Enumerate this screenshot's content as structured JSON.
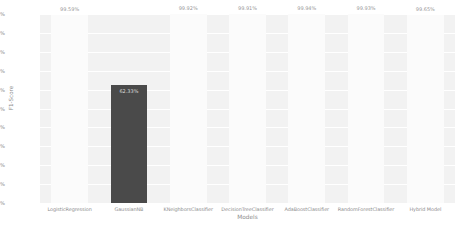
{
  "chart_data": {
    "type": "bar",
    "title": "",
    "xlabel": "Models",
    "ylabel": "F1-Score",
    "ylim": [
      0,
      100
    ],
    "grid": true,
    "legend": "none",
    "yticks": [
      "100%",
      "90%",
      "80%",
      "70%",
      "60%",
      "50%",
      "40%",
      "30%",
      "20%",
      "10%",
      "0%"
    ],
    "categories": [
      "LogisticRegression",
      "GaussianNB",
      "KNeighborsClassifier",
      "DecisionTreeClassifier",
      "AdaBoostClassifier",
      "RandomForestClassifier",
      "Hybrid Model"
    ],
    "values": [
      99.59,
      62.33,
      99.92,
      99.91,
      99.94,
      99.93,
      99.65
    ],
    "data_labels": [
      "99.59%",
      "62.33%",
      "99.92%",
      "99.91%",
      "99.94%",
      "99.93%",
      "99.65%"
    ],
    "bar_colors": [
      "#fbfbfb",
      "#4a4a4a",
      "#fbfbfb",
      "#fbfbfb",
      "#fbfbfb",
      "#fbfbfb",
      "#fbfbfb"
    ],
    "plot_background": "#f2f2f2",
    "grid_color": "#ffffff",
    "tick_color": "#8c8c8c"
  }
}
